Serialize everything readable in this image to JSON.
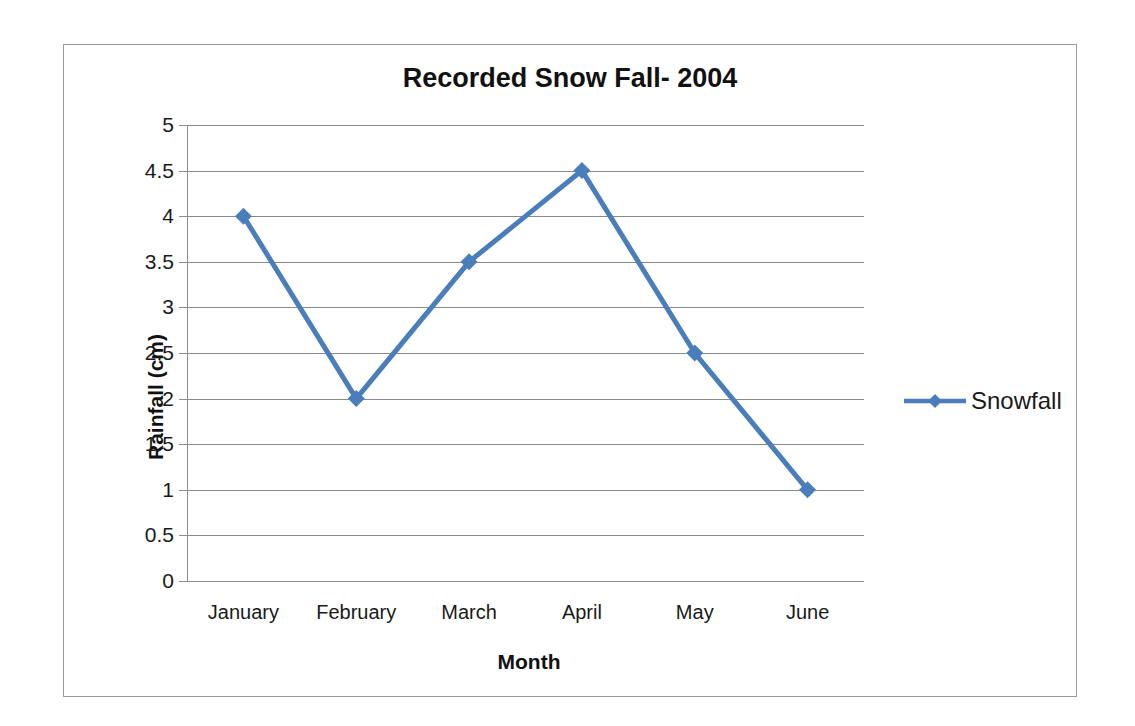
{
  "chart_data": {
    "type": "line",
    "title": "Recorded Snow Fall- 2004",
    "xlabel": "Month",
    "ylabel": "Rainfall (cm)",
    "categories": [
      "January",
      "February",
      "March",
      "April",
      "May",
      "June"
    ],
    "series": [
      {
        "name": "Snowfall",
        "values": [
          4,
          2,
          3.5,
          4.5,
          2.5,
          1
        ],
        "color": "#4a7ebb",
        "marker": "diamond"
      }
    ],
    "ylim": [
      0,
      5
    ],
    "ytick_step": 0.5,
    "yticks": [
      "0",
      "0.5",
      "1",
      "1.5",
      "2",
      "2.5",
      "3",
      "3.5",
      "4",
      "4.5",
      "5"
    ],
    "grid": "horizontal",
    "legend_position": "right",
    "legend_entries": [
      "Snowfall"
    ]
  },
  "colors": {
    "series_blue": "#4a7ebb",
    "gridline": "#898989",
    "axis": "#8d8d8d",
    "frame_border": "#9a9a9a",
    "text": "#1a1a1a",
    "background": "#ffffff"
  }
}
